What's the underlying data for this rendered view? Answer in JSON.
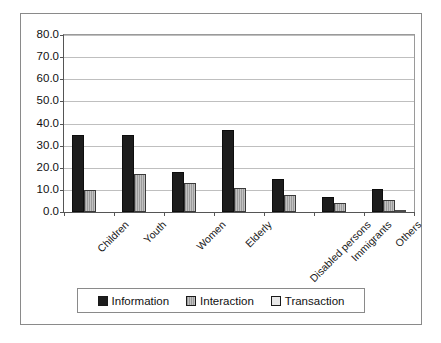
{
  "chart_data": {
    "type": "bar",
    "title": "",
    "subtitle": "",
    "xlabel": "",
    "ylabel": "",
    "ylim": [
      0,
      80
    ],
    "ytick_step": 10,
    "ytick_labels": [
      "80.0",
      "70.0",
      "60.0",
      "50.0",
      "40.0",
      "30.0",
      "20.0",
      "10.0",
      "0.0"
    ],
    "ytick_values": [
      80,
      70,
      60,
      50,
      40,
      30,
      20,
      10,
      0
    ],
    "grid": true,
    "grid_axis": "y",
    "legend_position": "bottom",
    "categories": [
      "Children",
      "Youth",
      "Women",
      "Elderly",
      "Disabled persons",
      "Immigrants",
      "Others"
    ],
    "series": [
      {
        "name": "Information",
        "color": "#1d1d1d",
        "values": [
          35.0,
          35.0,
          18.0,
          37.0,
          15.0,
          7.0,
          10.5
        ]
      },
      {
        "name": "Interaction",
        "color": "#a8a8a8",
        "values": [
          10.0,
          17.0,
          13.0,
          11.0,
          7.5,
          4.0,
          5.5
        ]
      },
      {
        "name": "Transaction",
        "color": "#e3e3e3",
        "values": [
          0.0,
          0.0,
          0.0,
          0.0,
          0.0,
          0.0,
          0.7
        ]
      }
    ]
  },
  "legend": {
    "items": [
      {
        "label": "Information",
        "swatch": "legend-swatch-information"
      },
      {
        "label": "Interaction",
        "swatch": "legend-swatch-interaction"
      },
      {
        "label": "Transaction",
        "swatch": "legend-swatch-transaction"
      }
    ]
  }
}
